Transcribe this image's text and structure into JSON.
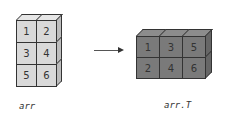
{
  "left": {
    "label": "arr",
    "grid": [
      [
        "1",
        "2"
      ],
      [
        "3",
        "4"
      ],
      [
        "5",
        "6"
      ]
    ],
    "colors": {
      "front": "#d9d9d9",
      "top": "#e6e6e6",
      "side": "#bdbdbd"
    }
  },
  "right": {
    "label": "arr.T",
    "grid": [
      [
        "1",
        "3",
        "5"
      ],
      [
        "2",
        "4",
        "6"
      ]
    ],
    "colors": {
      "front": "#7a7a7a",
      "top": "#8c8c8c",
      "side": "#666666"
    }
  },
  "arrow": {
    "direction": "right"
  }
}
